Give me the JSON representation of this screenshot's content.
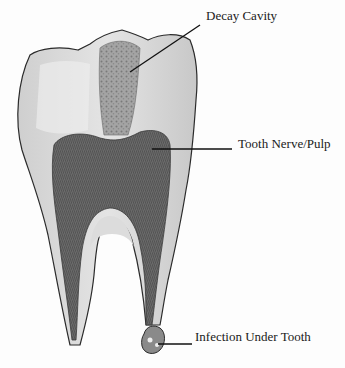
{
  "diagram": {
    "labels": [
      {
        "id": "decay",
        "text": "Decay Cavity"
      },
      {
        "id": "nerve",
        "text": "Tooth Nerve/Pulp"
      },
      {
        "id": "infection",
        "text": "Infection Under Tooth"
      }
    ],
    "colors": {
      "enamel": "#e6e6e6",
      "dentin": "#d2d2d2",
      "pulp": "#6e6e6e",
      "decay": "#9a9a9a",
      "outline": "#2b2b2b",
      "leader_line": "#111111",
      "background": "#fdfdfd"
    }
  }
}
